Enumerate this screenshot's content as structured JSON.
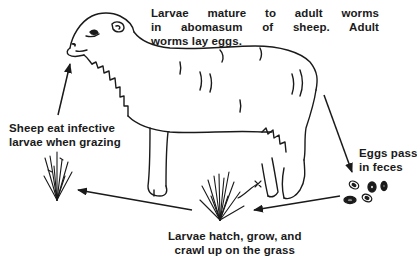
{
  "diagram": {
    "stages": [
      {
        "id": "adult",
        "lines": [
          "Larvae mature to adult worms",
          "in abomasum of sheep. Adult",
          "worms lay eggs."
        ]
      },
      {
        "id": "eggs",
        "lines": [
          "Eggs pass",
          "in feces"
        ]
      },
      {
        "id": "hatch",
        "lines": [
          "Larvae hatch, grow, and",
          "crawl up on the grass"
        ]
      },
      {
        "id": "ingest",
        "lines": [
          "Sheep eat infective",
          "larvae when grazing"
        ]
      }
    ],
    "arrows": [
      {
        "from": "sheep",
        "to": "eggs"
      },
      {
        "from": "eggs",
        "to": "grass-right"
      },
      {
        "from": "grass-right",
        "to": "grass-left"
      },
      {
        "from": "grass-left",
        "to": "sheep-mouth"
      }
    ],
    "colors": {
      "ink": "#1a1a1a",
      "background": "#ffffff"
    }
  }
}
